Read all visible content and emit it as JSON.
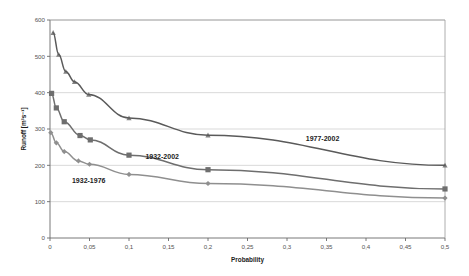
{
  "chart_data": {
    "type": "line",
    "title": "",
    "xlabel": "Probability",
    "ylabel": "Runoff [m3s-1]",
    "ylabel_display": "Runoff [m³s⁻¹]",
    "xlim": [
      0,
      0.5
    ],
    "ylim": [
      0,
      600
    ],
    "xticks": [
      0,
      0.05,
      0.1,
      0.15,
      0.2,
      0.25,
      0.3,
      0.35,
      0.4,
      0.45,
      0.5
    ],
    "xticklabels": [
      "0",
      "0,05",
      "0,1",
      "0,15",
      "0,2",
      "0,25",
      "0,3",
      "0,35",
      "0,4",
      "0,45",
      "0,5"
    ],
    "yticks": [
      0,
      100,
      200,
      300,
      400,
      500,
      600
    ],
    "yticklabels": [
      "0",
      "100",
      "200",
      "300",
      "400",
      "500",
      "600"
    ],
    "grid": {
      "horizontal": true,
      "vertical": false
    },
    "legend_position": "inline-annotations",
    "series": [
      {
        "name": "1977-2002",
        "color": "#5a5a5a",
        "marker": "triangle",
        "label_x": 0.345,
        "label_y": 268,
        "points": [
          {
            "x": 0.004,
            "y": 565
          },
          {
            "x": 0.011,
            "y": 505
          },
          {
            "x": 0.02,
            "y": 458
          },
          {
            "x": 0.031,
            "y": 430
          },
          {
            "x": 0.049,
            "y": 395
          },
          {
            "x": 0.1,
            "y": 330
          },
          {
            "x": 0.2,
            "y": 283
          },
          {
            "x": 0.5,
            "y": 200
          }
        ]
      },
      {
        "name": "1932-2002",
        "color": "#6e6e6e",
        "marker": "square",
        "label_x": 0.142,
        "label_y": 218,
        "points": [
          {
            "x": 0.002,
            "y": 398
          },
          {
            "x": 0.008,
            "y": 358
          },
          {
            "x": 0.018,
            "y": 320
          },
          {
            "x": 0.038,
            "y": 282
          },
          {
            "x": 0.051,
            "y": 270
          },
          {
            "x": 0.1,
            "y": 228
          },
          {
            "x": 0.2,
            "y": 188
          },
          {
            "x": 0.5,
            "y": 135
          }
        ]
      },
      {
        "name": "1932-1976",
        "color": "#8f8f8f",
        "marker": "diamond",
        "label_x": 0.049,
        "label_y": 152,
        "points": [
          {
            "x": 0.001,
            "y": 290
          },
          {
            "x": 0.008,
            "y": 262
          },
          {
            "x": 0.018,
            "y": 238
          },
          {
            "x": 0.036,
            "y": 212
          },
          {
            "x": 0.05,
            "y": 203
          },
          {
            "x": 0.1,
            "y": 175
          },
          {
            "x": 0.2,
            "y": 150
          },
          {
            "x": 0.5,
            "y": 110
          }
        ]
      }
    ]
  },
  "figure": {
    "background": "#ffffff",
    "plot_background": "#ffffff",
    "axis_color": "#7a7a7a",
    "grid_color": "#c8c8c8"
  }
}
